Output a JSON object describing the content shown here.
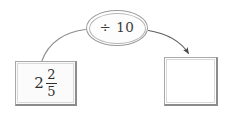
{
  "diagram": {
    "type": "function-machine",
    "background_color": "#ffffff",
    "operation": {
      "label": "÷ 10",
      "operator_symbol": "÷",
      "operand": "10",
      "shape": "ellipse",
      "border_color": "#9a9a9a",
      "text_color": "#3b3b3b"
    },
    "input_box": {
      "value_type": "mixed-number",
      "whole": "2",
      "numerator": "2",
      "denominator": "5",
      "plain_text": "2 2/5",
      "fill_color": "#fbfbfb",
      "border_color": "#8c8c8c"
    },
    "output_box": {
      "value": "",
      "is_empty": true,
      "fill_color": "#ffffff",
      "border_color": "#8c8c8c"
    },
    "connectors": [
      {
        "name": "input-to-operation",
        "from": "input_box",
        "to": "operation",
        "has_arrowhead": false,
        "color": "#8f8f8f"
      },
      {
        "name": "operation-to-output",
        "from": "operation",
        "to": "output_box",
        "has_arrowhead": true,
        "color": "#5f5f5f"
      }
    ]
  }
}
